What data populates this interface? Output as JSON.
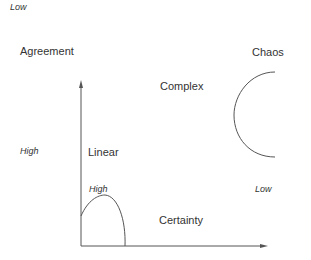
{
  "diagram": {
    "labels": {
      "agreement_low": "Low",
      "agreement_axis": "Agreement",
      "agreement_high": "High",
      "certainty_high": "High",
      "certainty_low": "Low",
      "certainty_axis": "Certainty",
      "zone_chaos": "Chaos",
      "zone_complex": "Complex",
      "zone_linear": "Linear"
    },
    "colors": {
      "line": "#555555",
      "text": "#333333"
    }
  }
}
